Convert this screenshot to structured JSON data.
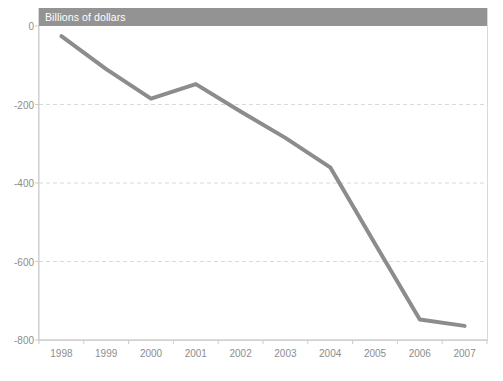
{
  "chart_data": {
    "type": "line",
    "title": "Billions of dollars",
    "xlabel": "",
    "ylabel": "",
    "categories": [
      "1998",
      "1999",
      "2000",
      "2001",
      "2002",
      "2003",
      "2004",
      "2005",
      "2006",
      "2007"
    ],
    "values": [
      -26,
      -110,
      -185,
      -148,
      -218,
      -285,
      -360,
      -555,
      -748,
      -764
    ],
    "series": [
      {
        "name": "Billions of dollars",
        "values": [
          -26,
          -110,
          -185,
          -148,
          -218,
          -285,
          -360,
          -555,
          -748,
          -764
        ]
      }
    ],
    "ylim": [
      -800,
      0
    ],
    "yticks": [
      0,
      -200,
      -400,
      -600,
      -800
    ],
    "ytick_labels": [
      "0",
      "-200",
      "-400",
      "-600",
      "-800"
    ],
    "xtick_labels": [
      "1998",
      "1999",
      "2000",
      "2001",
      "2002",
      "2003",
      "2004",
      "2005",
      "2006",
      "2007"
    ],
    "grid": "horizontal-dashed",
    "legend": "none",
    "line_color": "#8c8c8c",
    "grid_color": "#d9d9d9",
    "axis_color": "#cccccc",
    "tick_label_color": "#8d8d8d",
    "header_background": "#939393",
    "header_text_color": "#ffffff",
    "plot_background": "#ffffff"
  },
  "header": {
    "title": "Billions of dollars"
  }
}
